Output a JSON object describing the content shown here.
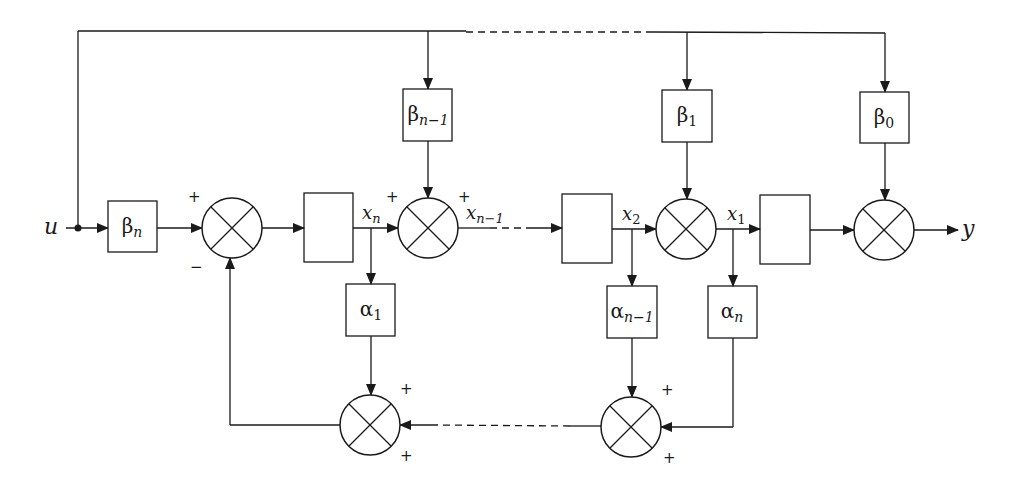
{
  "diagram": {
    "type": "block-diagram",
    "input": {
      "label": "u"
    },
    "output": {
      "label": "y"
    },
    "feedforward_gains": [
      {
        "id": "beta_n",
        "symbol": "β",
        "sub": "n"
      },
      {
        "id": "beta_n_minus_1",
        "symbol": "β",
        "sub": "n−1"
      },
      {
        "id": "beta_1",
        "symbol": "β",
        "sub": "1"
      },
      {
        "id": "beta_0",
        "symbol": "β",
        "sub": "0"
      }
    ],
    "feedback_gains": [
      {
        "id": "alpha_1",
        "symbol": "α",
        "sub": "1"
      },
      {
        "id": "alpha_n_minus_1",
        "symbol": "α",
        "sub": "n−1"
      },
      {
        "id": "alpha_n",
        "symbol": "α",
        "sub": "n"
      }
    ],
    "states": [
      {
        "id": "x_n",
        "symbol": "x",
        "sub": "n"
      },
      {
        "id": "x_n_minus_1",
        "symbol": "x",
        "sub": "n−1"
      },
      {
        "id": "x_2",
        "symbol": "x",
        "sub": "2"
      },
      {
        "id": "x_1",
        "symbol": "x",
        "sub": "1"
      }
    ],
    "integrator_blocks": 4,
    "summing_junctions": 6,
    "signs": {
      "plus": "+",
      "minus": "−"
    }
  }
}
